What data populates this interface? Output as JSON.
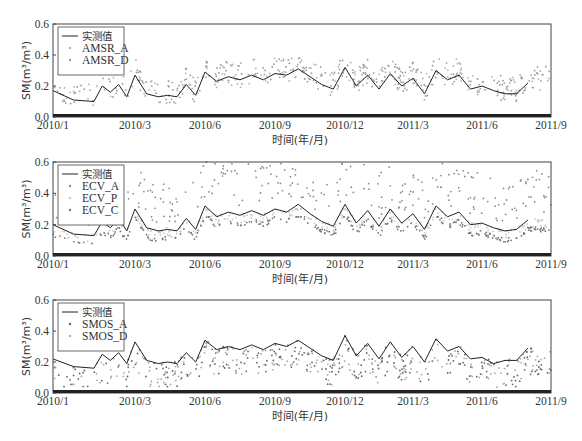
{
  "figure": {
    "x_axis_title": "时间(年/月)",
    "y_axis_title": "SM(m³/m³)",
    "x_tick_labels": [
      "2010/1",
      "2010/3",
      "2010/6",
      "2010/9",
      "2010/12",
      "2011/3",
      "2011/6",
      "2011/9"
    ],
    "y_tick_labels": [
      "0.0",
      "0.2",
      "0.4",
      "0.6"
    ]
  },
  "chart_data": [
    {
      "type": "line+scatter",
      "title": "",
      "xlabel": "时间(年/月)",
      "ylabel": "SM(m³/m³)",
      "ylim": [
        0,
        0.6
      ],
      "xlim": [
        "2010/1",
        "2011/9"
      ],
      "x_ticks": [
        "2010/1",
        "2010/3",
        "2010/6",
        "2010/9",
        "2010/12",
        "2011/3",
        "2011/6",
        "2011/9"
      ],
      "y_ticks": [
        0.0,
        0.2,
        0.4,
        0.6
      ],
      "grid": false,
      "legend_position": "upper left",
      "legend": [
        "实测值",
        "AMSR_A",
        "AMSR_D"
      ],
      "series": [
        {
          "name": "实测值",
          "style": "line",
          "color": "#222222",
          "x": [
            "2010/1",
            "2010/1.5",
            "2010/2",
            "2010/2.2",
            "2010/2.4",
            "2010/2.6",
            "2010/2.8",
            "2010/3",
            "2010/3.5",
            "2010/4",
            "2010/4.4",
            "2010/4.8",
            "2010/5.2",
            "2010/5.6",
            "2010/6",
            "2010/6.5",
            "2010/7",
            "2010/7.5",
            "2010/8",
            "2010/8.5",
            "2010/9",
            "2010/9.5",
            "2010/10",
            "2010/10.5",
            "2010/11",
            "2010/11.5",
            "2010/12",
            "2010/12.5",
            "2011/1",
            "2011/1.5",
            "2011/2",
            "2011/2.5",
            "2011/3",
            "2011/3.5",
            "2011/4",
            "2011/4.5",
            "2011/5",
            "2011/5.5",
            "2011/6",
            "2011/6.5",
            "2011/7",
            "2011/7.5",
            "2011/8"
          ],
          "values": [
            0.17,
            0.11,
            0.1,
            0.2,
            0.16,
            0.21,
            0.13,
            0.27,
            0.15,
            0.13,
            0.14,
            0.13,
            0.21,
            0.14,
            0.29,
            0.23,
            0.26,
            0.24,
            0.27,
            0.24,
            0.28,
            0.27,
            0.31,
            0.26,
            0.21,
            0.18,
            0.32,
            0.2,
            0.27,
            0.18,
            0.28,
            0.2,
            0.25,
            0.15,
            0.3,
            0.24,
            0.27,
            0.18,
            0.2,
            0.17,
            0.15,
            0.15,
            0.22
          ]
        },
        {
          "name": "AMSR_A",
          "style": "scatter",
          "color": "#b0b0b0",
          "range_hint": [
            0.05,
            0.55
          ]
        },
        {
          "name": "AMSR_D",
          "style": "scatter",
          "color": "#9a9a9a",
          "range_hint": [
            0.05,
            0.45
          ]
        }
      ]
    },
    {
      "type": "line+scatter",
      "title": "",
      "xlabel": "时间(年/月)",
      "ylabel": "SM(m³/m³)",
      "ylim": [
        0,
        0.6
      ],
      "xlim": [
        "2010/1",
        "2011/9"
      ],
      "x_ticks": [
        "2010/1",
        "2010/3",
        "2010/6",
        "2010/9",
        "2010/12",
        "2011/3",
        "2011/6",
        "2011/9"
      ],
      "y_ticks": [
        0.0,
        0.2,
        0.4,
        0.6
      ],
      "grid": false,
      "legend_position": "upper left",
      "legend": [
        "实测值",
        "ECV_A",
        "ECV_P",
        "ECV_C"
      ],
      "series": [
        {
          "name": "实测值",
          "style": "line",
          "color": "#222222",
          "x": [
            "2010/1",
            "2010/1.5",
            "2010/2",
            "2010/2.2",
            "2010/2.4",
            "2010/2.6",
            "2010/2.8",
            "2010/3",
            "2010/3.5",
            "2010/4",
            "2010/4.4",
            "2010/4.8",
            "2010/5.2",
            "2010/5.6",
            "2010/6",
            "2010/6.5",
            "2010/7",
            "2010/7.5",
            "2010/8",
            "2010/8.5",
            "2010/9",
            "2010/9.5",
            "2010/10",
            "2010/10.5",
            "2010/11",
            "2010/11.5",
            "2010/12",
            "2010/12.5",
            "2011/1",
            "2011/1.5",
            "2011/2",
            "2011/2.5",
            "2011/3",
            "2011/3.5",
            "2011/4",
            "2011/4.5",
            "2011/5",
            "2011/5.5",
            "2011/6",
            "2011/6.5",
            "2011/7",
            "2011/7.5",
            "2011/8"
          ],
          "values": [
            0.2,
            0.14,
            0.13,
            0.22,
            0.18,
            0.24,
            0.16,
            0.3,
            0.18,
            0.16,
            0.17,
            0.16,
            0.24,
            0.17,
            0.32,
            0.25,
            0.28,
            0.26,
            0.29,
            0.26,
            0.3,
            0.28,
            0.33,
            0.27,
            0.22,
            0.19,
            0.33,
            0.21,
            0.29,
            0.19,
            0.3,
            0.21,
            0.27,
            0.17,
            0.32,
            0.25,
            0.28,
            0.2,
            0.21,
            0.18,
            0.16,
            0.17,
            0.23
          ]
        },
        {
          "name": "ECV_A",
          "style": "scatter",
          "color": "#8c8c8c",
          "range_hint": [
            0.15,
            0.6
          ]
        },
        {
          "name": "ECV_P",
          "style": "scatter",
          "color": "#c8c8c8",
          "range_hint": [
            0.05,
            0.3
          ]
        },
        {
          "name": "ECV_C",
          "style": "scatter",
          "color": "#777777",
          "range_hint": [
            0.08,
            0.25
          ]
        }
      ]
    },
    {
      "type": "line+scatter",
      "title": "",
      "xlabel": "时间(年/月)",
      "ylabel": "SM(m³/m³)",
      "ylim": [
        0,
        0.6
      ],
      "xlim": [
        "2010/1",
        "2011/9"
      ],
      "x_ticks": [
        "2010/1",
        "2010/3",
        "2010/6",
        "2010/9",
        "2010/12",
        "2011/3",
        "2011/6",
        "2011/9"
      ],
      "y_ticks": [
        0.0,
        0.2,
        0.4,
        0.6
      ],
      "grid": false,
      "legend_position": "upper left",
      "legend": [
        "实测值",
        "SMOS_A",
        "SMOS_D"
      ],
      "series": [
        {
          "name": "实测值",
          "style": "line",
          "color": "#222222",
          "x": [
            "2010/1",
            "2010/1.5",
            "2010/2",
            "2010/2.2",
            "2010/2.4",
            "2010/2.6",
            "2010/2.8",
            "2010/3",
            "2010/3.5",
            "2010/4",
            "2010/4.4",
            "2010/4.8",
            "2010/5.2",
            "2010/5.6",
            "2010/6",
            "2010/6.5",
            "2010/7",
            "2010/7.5",
            "2010/8",
            "2010/8.5",
            "2010/9",
            "2010/9.5",
            "2010/10",
            "2010/10.5",
            "2010/11",
            "2010/11.5",
            "2010/12",
            "2010/12.5",
            "2011/1",
            "2011/1.5",
            "2011/2",
            "2011/2.5",
            "2011/3",
            "2011/3.5",
            "2011/4",
            "2011/4.5",
            "2011/5",
            "2011/5.5",
            "2011/6",
            "2011/6.5",
            "2011/7",
            "2011/7.5",
            "2011/8"
          ],
          "values": [
            0.22,
            0.17,
            0.16,
            0.25,
            0.21,
            0.26,
            0.19,
            0.33,
            0.21,
            0.19,
            0.2,
            0.19,
            0.26,
            0.2,
            0.34,
            0.28,
            0.3,
            0.28,
            0.31,
            0.28,
            0.32,
            0.3,
            0.34,
            0.29,
            0.24,
            0.21,
            0.37,
            0.24,
            0.32,
            0.22,
            0.33,
            0.23,
            0.3,
            0.2,
            0.35,
            0.27,
            0.3,
            0.22,
            0.23,
            0.19,
            0.21,
            0.21,
            0.29
          ]
        },
        {
          "name": "SMOS_A",
          "style": "scatter",
          "color": "#666666",
          "range_hint": [
            0.0,
            0.52
          ]
        },
        {
          "name": "SMOS_D",
          "style": "scatter",
          "color": "#a8a8a8",
          "range_hint": [
            0.0,
            0.45
          ]
        }
      ]
    }
  ]
}
